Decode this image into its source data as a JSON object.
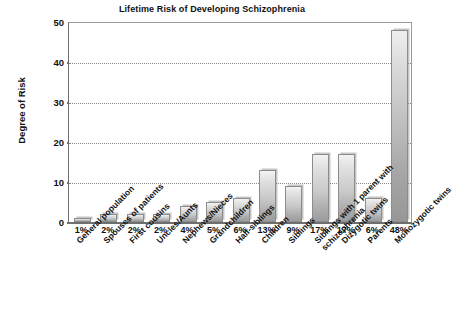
{
  "chart_data": {
    "type": "bar",
    "title": "Lifetime Risk of Developing Schizophrenia",
    "xlabel": "",
    "ylabel": "Degree of Risk",
    "ylim": [
      0,
      50
    ],
    "yticks": [
      0,
      10,
      20,
      30,
      40,
      50
    ],
    "grid": true,
    "legend": "none",
    "categories": [
      "General population",
      "Spouses of patients",
      "First cousins",
      "Uncles/Aunts",
      "Nephews/Nieces",
      "Grandchildren",
      "Half-siblings",
      "Children",
      "Siblings",
      "Siblings with 1 parent with schizophrenia",
      "Dizygotic twins",
      "Parents",
      "Monozygotic twins"
    ],
    "values": [
      1,
      2,
      2,
      2,
      4,
      5,
      6,
      13,
      9,
      17,
      17,
      6,
      48
    ],
    "data_labels": [
      "1%",
      "2%",
      "2%",
      "2%",
      "4%",
      "5%",
      "6%",
      "13%",
      "9%",
      "17%",
      "17%",
      "6%",
      "48%"
    ]
  },
  "colors": {
    "bar_top": "#f2f2f2",
    "bar_bottom": "#9c9c9c",
    "bar_border": "#8c8c8c",
    "axis": "#6f6f6f",
    "grid": "#8a8a8a",
    "text": "#111111",
    "background": "#ffffff"
  }
}
